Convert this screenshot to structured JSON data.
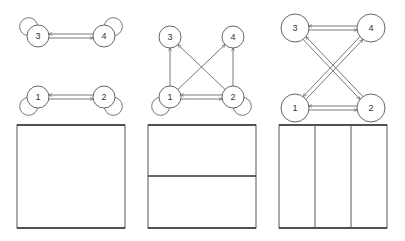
{
  "panels": [
    {
      "id": "panel-1",
      "nodes": [
        {
          "label": "3",
          "x": 38,
          "y": 36,
          "r": 11,
          "self_loop": "upper-left"
        },
        {
          "label": "4",
          "x": 104,
          "y": 36,
          "r": 11,
          "self_loop": "upper-right"
        },
        {
          "label": "1",
          "x": 38,
          "y": 97,
          "r": 11,
          "self_loop": "lower-left"
        },
        {
          "label": "2",
          "x": 104,
          "y": 97,
          "r": 11,
          "self_loop": "lower-right"
        }
      ],
      "edges": [
        {
          "from": "3",
          "to": "4",
          "type": "bidirectional"
        },
        {
          "from": "1",
          "to": "2",
          "type": "bidirectional"
        }
      ],
      "box": {
        "x": 17,
        "y": 125,
        "w": 108,
        "h": 103,
        "partition": "single",
        "dividers": []
      }
    },
    {
      "id": "panel-2",
      "nodes": [
        {
          "label": "3",
          "x": 170,
          "y": 37,
          "r": 11,
          "self_loop": null
        },
        {
          "label": "4",
          "x": 233,
          "y": 37,
          "r": 11,
          "self_loop": null
        },
        {
          "label": "1",
          "x": 170,
          "y": 97,
          "r": 11,
          "self_loop": "lower-left"
        },
        {
          "label": "2",
          "x": 233,
          "y": 97,
          "r": 11,
          "self_loop": "lower-right"
        }
      ],
      "edges": [
        {
          "from": "1",
          "to": "2",
          "type": "bidirectional"
        },
        {
          "from": "1",
          "to": "3",
          "type": "directed"
        },
        {
          "from": "1",
          "to": "4",
          "type": "directed"
        },
        {
          "from": "2",
          "to": "3",
          "type": "directed"
        },
        {
          "from": "2",
          "to": "4",
          "type": "directed"
        }
      ],
      "box": {
        "x": 148,
        "y": 125,
        "w": 108,
        "h": 103,
        "partition": "horizontal-halves",
        "dividers": [
          {
            "orientation": "horizontal",
            "pos": 176
          }
        ]
      }
    },
    {
      "id": "panel-3",
      "nodes": [
        {
          "label": "3",
          "x": 295,
          "y": 28,
          "r": 14,
          "self_loop": null
        },
        {
          "label": "4",
          "x": 371,
          "y": 28,
          "r": 14,
          "self_loop": null
        },
        {
          "label": "1",
          "x": 295,
          "y": 108,
          "r": 14,
          "self_loop": null
        },
        {
          "label": "2",
          "x": 371,
          "y": 108,
          "r": 14,
          "self_loop": null
        }
      ],
      "edges": [
        {
          "from": "3",
          "to": "4",
          "type": "bidirectional"
        },
        {
          "from": "1",
          "to": "2",
          "type": "bidirectional"
        },
        {
          "from": "1",
          "to": "4",
          "type": "bidirectional"
        },
        {
          "from": "3",
          "to": "2",
          "type": "bidirectional"
        }
      ],
      "box": {
        "x": 279,
        "y": 125,
        "w": 108,
        "h": 103,
        "partition": "vertical-thirds",
        "dividers": [
          {
            "orientation": "vertical",
            "pos": 315
          },
          {
            "orientation": "vertical",
            "pos": 351
          }
        ]
      }
    }
  ]
}
